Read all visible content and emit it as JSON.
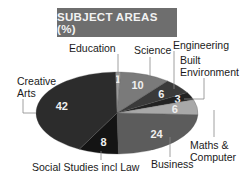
{
  "chart_data": {
    "type": "pie",
    "title": "SUBJECT AREAS (%)",
    "categories": [
      "Education",
      "Science",
      "Engineering",
      "Built Environment",
      "Maths & Computer",
      "Business",
      "Social Studies incl Law",
      "Creative Arts"
    ],
    "values": [
      1,
      10,
      6,
      3,
      6,
      24,
      8,
      42
    ],
    "unit": "%",
    "colors": [
      "#9a9a9a",
      "#7a7a7a",
      "#3a3a3a",
      "#222222",
      "#a8a8a8",
      "#5c5c5c",
      "#141414",
      "#2c2c2c"
    ],
    "legend_position": "callout labels",
    "grid": false
  },
  "labels": {
    "title": "SUBJECT AREAS (%)",
    "education": "Education",
    "science": "Science",
    "engineering": "Engineering",
    "built1": "Built",
    "built2": "Environment",
    "creative1": "Creative",
    "creative2": "Arts",
    "maths1": "Maths &",
    "maths2": "Computer",
    "business": "Business",
    "social": "Social Studies incl Law"
  }
}
